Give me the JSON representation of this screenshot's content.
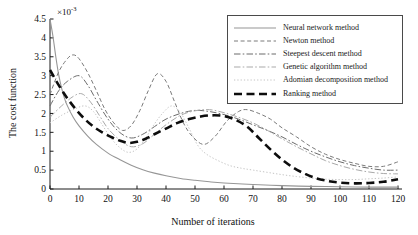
{
  "figure": {
    "ylabel": "The cost function",
    "xlabel": "Number of iterations",
    "exponent_base": "×10",
    "exponent_power": "-3",
    "background": "#ffffff",
    "axis_color": "#1a1a1a"
  },
  "chart_data": {
    "type": "line",
    "title": "",
    "xlabel": "Number of iterations",
    "ylabel": "The cost function",
    "y_unit_multiplier": "1e-3",
    "xlim": [
      0,
      120
    ],
    "ylim": [
      0,
      4.5
    ],
    "xticks": [
      0,
      10,
      20,
      30,
      40,
      50,
      60,
      70,
      80,
      90,
      100,
      110,
      120
    ],
    "yticks": [
      0,
      0.5,
      1,
      1.5,
      2,
      2.5,
      3,
      3.5,
      4,
      4.5
    ],
    "grid": false,
    "legend_position": "upper right",
    "series": [
      {
        "name": "Neural network method",
        "slug": "neural-network",
        "color": "#969696",
        "dash": "",
        "width": 1.1,
        "points": [
          [
            0,
            4.5
          ],
          [
            1,
            4.05
          ],
          [
            2,
            3.5
          ],
          [
            3,
            3.02
          ],
          [
            4,
            2.67
          ],
          [
            5,
            2.4
          ],
          [
            6,
            2.2
          ],
          [
            8,
            1.9
          ],
          [
            10,
            1.67
          ],
          [
            13,
            1.4
          ],
          [
            16,
            1.18
          ],
          [
            20,
            0.95
          ],
          [
            24,
            0.78
          ],
          [
            28,
            0.63
          ],
          [
            32,
            0.51
          ],
          [
            36,
            0.42
          ],
          [
            40,
            0.35
          ],
          [
            45,
            0.28
          ],
          [
            50,
            0.23
          ],
          [
            55,
            0.19
          ],
          [
            60,
            0.16
          ],
          [
            70,
            0.12
          ],
          [
            80,
            0.09
          ],
          [
            90,
            0.07
          ],
          [
            100,
            0.06
          ],
          [
            110,
            0.05
          ],
          [
            120,
            0.05
          ]
        ]
      },
      {
        "name": "Newton method",
        "slug": "newton",
        "color": "#7a7a7a",
        "dash": "4,2.6",
        "width": 1,
        "points": [
          [
            0,
            2.5
          ],
          [
            3,
            3.1
          ],
          [
            6,
            3.45
          ],
          [
            8,
            3.55
          ],
          [
            10,
            3.45
          ],
          [
            13,
            3.08
          ],
          [
            16,
            2.6
          ],
          [
            19,
            2.1
          ],
          [
            22,
            1.75
          ],
          [
            25,
            1.55
          ],
          [
            28,
            1.68
          ],
          [
            31,
            2.08
          ],
          [
            34,
            2.62
          ],
          [
            37,
            3.05
          ],
          [
            40,
            2.85
          ],
          [
            43,
            2.3
          ],
          [
            46,
            1.75
          ],
          [
            49,
            1.4
          ],
          [
            53,
            1.18
          ],
          [
            57,
            1.4
          ],
          [
            61,
            1.8
          ],
          [
            65,
            2.05
          ],
          [
            68,
            2.1
          ],
          [
            72,
            2.0
          ],
          [
            76,
            1.85
          ],
          [
            80,
            1.62
          ],
          [
            85,
            1.38
          ],
          [
            90,
            1.12
          ],
          [
            95,
            0.92
          ],
          [
            100,
            0.78
          ],
          [
            105,
            0.68
          ],
          [
            110,
            0.6
          ],
          [
            115,
            0.6
          ],
          [
            120,
            0.72
          ]
        ]
      },
      {
        "name": "Steepest descent method",
        "slug": "steepest-descent",
        "color": "#6b6b6b",
        "dash": "6.5,2.2,1.6,2.2",
        "width": 1,
        "points": [
          [
            0,
            2.2
          ],
          [
            3,
            2.6
          ],
          [
            6,
            2.85
          ],
          [
            10,
            3.0
          ],
          [
            13,
            2.75
          ],
          [
            16,
            2.35
          ],
          [
            20,
            1.85
          ],
          [
            24,
            1.5
          ],
          [
            28,
            1.35
          ],
          [
            32,
            1.45
          ],
          [
            36,
            1.65
          ],
          [
            40,
            1.85
          ],
          [
            45,
            2.0
          ],
          [
            50,
            2.08
          ],
          [
            55,
            2.05
          ],
          [
            60,
            1.97
          ],
          [
            65,
            1.85
          ],
          [
            70,
            1.7
          ],
          [
            75,
            1.55
          ],
          [
            80,
            1.38
          ],
          [
            85,
            1.18
          ],
          [
            90,
            1.0
          ],
          [
            95,
            0.85
          ],
          [
            100,
            0.72
          ],
          [
            105,
            0.62
          ],
          [
            110,
            0.55
          ],
          [
            115,
            0.5
          ],
          [
            120,
            0.5
          ]
        ]
      },
      {
        "name": "Genetic algorithm method",
        "slug": "genetic-algorithm",
        "color": "#a9a9a9",
        "dash": "6.5,2.2,1.6,2.2",
        "width": 1,
        "points": [
          [
            0,
            1.9
          ],
          [
            4,
            2.2
          ],
          [
            8,
            2.45
          ],
          [
            11,
            2.52
          ],
          [
            14,
            2.3
          ],
          [
            17,
            1.95
          ],
          [
            20,
            1.6
          ],
          [
            24,
            1.3
          ],
          [
            28,
            1.12
          ],
          [
            32,
            1.2
          ],
          [
            36,
            1.45
          ],
          [
            40,
            1.7
          ],
          [
            45,
            1.95
          ],
          [
            50,
            2.07
          ],
          [
            55,
            2.1
          ],
          [
            60,
            2.02
          ],
          [
            65,
            1.9
          ],
          [
            70,
            1.75
          ],
          [
            75,
            1.55
          ],
          [
            80,
            1.33
          ],
          [
            85,
            1.12
          ],
          [
            90,
            0.93
          ],
          [
            95,
            0.75
          ],
          [
            100,
            0.62
          ],
          [
            105,
            0.52
          ],
          [
            110,
            0.45
          ],
          [
            115,
            0.41
          ],
          [
            120,
            0.4
          ]
        ]
      },
      {
        "name": "Adomian decomposition method",
        "slug": "adomian-decomposition",
        "color": "#c4c4c4",
        "dash": "1.3,2",
        "width": 1,
        "points": [
          [
            0,
            1.75
          ],
          [
            4,
            1.95
          ],
          [
            8,
            2.1
          ],
          [
            12,
            2.2
          ],
          [
            15,
            2.05
          ],
          [
            18,
            1.7
          ],
          [
            21,
            1.35
          ],
          [
            24,
            1.1
          ],
          [
            27,
            0.97
          ],
          [
            30,
            1.06
          ],
          [
            33,
            1.35
          ],
          [
            36,
            1.72
          ],
          [
            39,
            2.02
          ],
          [
            42,
            2.2
          ],
          [
            45,
            2.02
          ],
          [
            48,
            1.6
          ],
          [
            51,
            1.15
          ],
          [
            54,
            0.92
          ],
          [
            58,
            0.75
          ],
          [
            62,
            0.62
          ],
          [
            66,
            0.55
          ],
          [
            70,
            0.5
          ],
          [
            75,
            0.44
          ],
          [
            80,
            0.38
          ],
          [
            85,
            0.33
          ],
          [
            90,
            0.29
          ],
          [
            95,
            0.26
          ],
          [
            100,
            0.25
          ],
          [
            105,
            0.25
          ],
          [
            110,
            0.27
          ],
          [
            115,
            0.29
          ],
          [
            120,
            0.32
          ]
        ]
      },
      {
        "name": "Ranking method",
        "slug": "ranking",
        "color": "#0d0d0d",
        "dash": "8,4.5",
        "width": 2.6,
        "points": [
          [
            0,
            3.15
          ],
          [
            3,
            2.75
          ],
          [
            6,
            2.4
          ],
          [
            9,
            2.1
          ],
          [
            12,
            1.85
          ],
          [
            15,
            1.65
          ],
          [
            18,
            1.5
          ],
          [
            21,
            1.38
          ],
          [
            24,
            1.28
          ],
          [
            27,
            1.22
          ],
          [
            30,
            1.25
          ],
          [
            33,
            1.33
          ],
          [
            36,
            1.45
          ],
          [
            40,
            1.6
          ],
          [
            44,
            1.75
          ],
          [
            48,
            1.85
          ],
          [
            52,
            1.92
          ],
          [
            56,
            1.95
          ],
          [
            60,
            1.93
          ],
          [
            64,
            1.83
          ],
          [
            68,
            1.65
          ],
          [
            72,
            1.35
          ],
          [
            76,
            1.05
          ],
          [
            80,
            0.78
          ],
          [
            84,
            0.56
          ],
          [
            88,
            0.4
          ],
          [
            92,
            0.28
          ],
          [
            96,
            0.21
          ],
          [
            100,
            0.17
          ],
          [
            105,
            0.15
          ],
          [
            110,
            0.16
          ],
          [
            115,
            0.19
          ],
          [
            120,
            0.26
          ]
        ]
      }
    ]
  }
}
